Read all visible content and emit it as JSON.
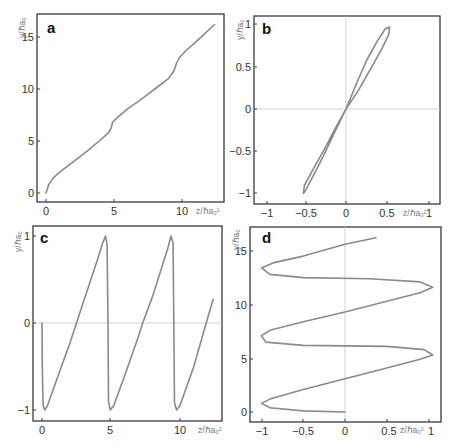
{
  "figure": {
    "panels": [
      {
        "id": "a",
        "letter": "a",
        "xlabel": "z/ℏa₀²",
        "ylabel": "y/ℏa₀",
        "xticks": [
          "0",
          "5",
          "10"
        ],
        "yticks": [
          "0",
          "5",
          "10",
          "15"
        ]
      },
      {
        "id": "b",
        "letter": "b",
        "xlabel": "z/ℏa₀²",
        "ylabel": "y/ℏa₀",
        "xticks": [
          "−1",
          "−0.5",
          "0",
          "0.5",
          "1"
        ],
        "yticks": [
          "−1",
          "−0.5",
          "0",
          "0.5",
          "1"
        ]
      },
      {
        "id": "c",
        "letter": "c",
        "xlabel": "z/ℏa₀²",
        "ylabel": "y/ℏa₀",
        "xticks": [
          "0",
          "5",
          "10"
        ],
        "yticks": [
          "−1",
          "0",
          "1"
        ]
      },
      {
        "id": "d",
        "letter": "d",
        "xlabel": "z/ℏa₀²",
        "ylabel": "y/ℏa₀",
        "xticks": [
          "−1",
          "−0.5",
          "0",
          "0.5",
          "1"
        ],
        "yticks": [
          "0",
          "5",
          "10",
          "15"
        ]
      }
    ],
    "curve_color": "#8a8a8a",
    "frame_color": "#3a3a3a",
    "zero_line_color": "#c8c8c8"
  },
  "chart_data": [
    {
      "panel": "a",
      "type": "line",
      "xlabel": "z/ℏa₀²",
      "ylabel": "y/ℏa₀",
      "xlim": [
        -0.7,
        13.1
      ],
      "ylim": [
        -0.9,
        17.1
      ],
      "grid": false,
      "x": [
        0,
        0.2,
        0.5,
        1,
        2,
        3,
        4,
        4.6,
        4.8,
        4.9,
        5.2,
        6,
        7,
        8,
        9,
        9.4,
        9.6,
        9.8,
        10.3,
        11,
        12.4
      ],
      "y": [
        0,
        0.8,
        1.4,
        2,
        3,
        4,
        5.1,
        5.8,
        6.3,
        6.8,
        7.2,
        8.1,
        9,
        10,
        11,
        11.7,
        12.5,
        13,
        13.7,
        14.5,
        16.2
      ]
    },
    {
      "panel": "b",
      "type": "line",
      "xlabel": "z/ℏa₀²",
      "ylabel": "y/ℏa₀",
      "xlim": [
        -1.15,
        1.15
      ],
      "ylim": [
        -1.1,
        1.1
      ],
      "grid": false,
      "zero_lines": true,
      "x": [
        0,
        0.25,
        0.5,
        0.75,
        0.95,
        1.05,
        1.03,
        0.85,
        0.6,
        0.3,
        0,
        -0.3,
        -0.55,
        -0.8,
        -0.98,
        -1.03,
        -1,
        -0.8,
        -0.55,
        -0.28,
        0
      ],
      "y": [
        0,
        0.3,
        0.58,
        0.8,
        0.95,
        0.97,
        0.88,
        0.7,
        0.48,
        0.22,
        0,
        -0.3,
        -0.56,
        -0.8,
        -0.97,
        -1,
        -0.9,
        -0.72,
        -0.5,
        -0.25,
        0
      ]
    },
    {
      "panel": "c",
      "type": "line",
      "xlabel": "z/ℏa₀²",
      "ylabel": "y/ℏa₀",
      "xlim": [
        -0.6,
        12.8
      ],
      "ylim": [
        -1.1,
        1.1
      ],
      "grid": false,
      "zero_lines": true,
      "x": [
        0,
        0.02,
        0.08,
        0.2,
        0.4,
        1,
        1.5,
        2,
        2.5,
        3,
        3.5,
        4,
        4.4,
        4.6,
        4.72,
        4.78,
        4.82,
        4.95,
        5.2,
        6,
        7,
        7.3,
        8,
        8.6,
        9.1,
        9.35,
        9.5,
        9.55,
        9.6,
        9.75,
        10,
        11,
        11.9,
        12.4
      ],
      "y": [
        0,
        -0.5,
        -0.95,
        -1,
        -0.95,
        -0.68,
        -0.46,
        -0.24,
        0,
        0.24,
        0.48,
        0.72,
        0.92,
        1,
        0.9,
        0,
        -0.9,
        -1,
        -0.95,
        -0.6,
        -0.15,
        0,
        0.3,
        0.6,
        0.85,
        1,
        0.92,
        0,
        -0.92,
        -1,
        -0.95,
        -0.5,
        0,
        0.27
      ]
    },
    {
      "panel": "d",
      "type": "line",
      "xlabel": "z/ℏa₀²",
      "ylabel": "y/ℏa₀",
      "xlim": [
        -1.15,
        1.15
      ],
      "ylim": [
        -0.9,
        17.1
      ],
      "grid": false,
      "zero_lines": true,
      "x": [
        0,
        -0.5,
        -0.9,
        -1,
        -0.9,
        -0.5,
        0,
        0.5,
        0.9,
        1.05,
        0.95,
        0.5,
        -0.5,
        -0.95,
        -1,
        -0.9,
        -0.5,
        0,
        0.5,
        0.9,
        1.05,
        0.9,
        0.3,
        -0.5,
        -0.9,
        -1,
        -0.85,
        -0.5,
        0,
        0.37
      ],
      "y": [
        0,
        0.1,
        0.4,
        0.8,
        1.2,
        2.1,
        3.1,
        4.1,
        4.9,
        5.3,
        5.8,
        6.1,
        6.2,
        6.5,
        7.1,
        7.6,
        8.4,
        9.3,
        10.3,
        11.1,
        11.6,
        12.1,
        12.4,
        12.5,
        12.8,
        13.4,
        13.9,
        14.5,
        15.6,
        16.2
      ]
    }
  ]
}
